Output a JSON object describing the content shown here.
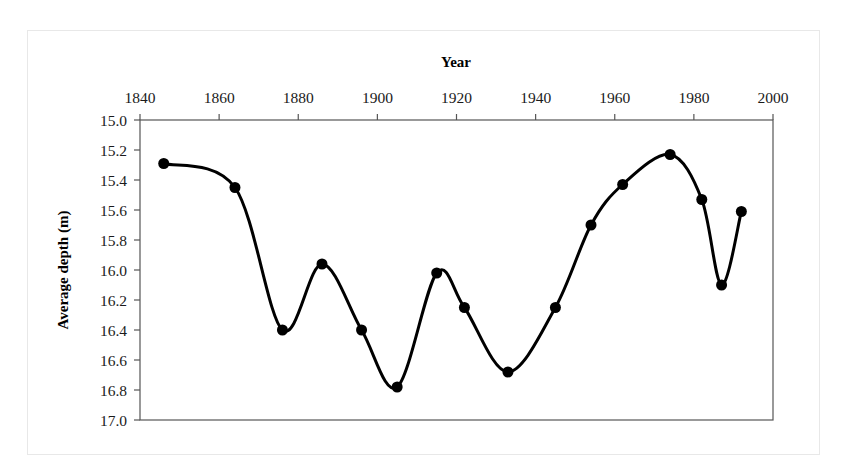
{
  "figure": {
    "background_color": "#ffffff",
    "outer_border_color": "#e8e8e8",
    "axis_color": "#555555",
    "series_color": "#000000"
  },
  "chart_data": {
    "type": "line",
    "title": "",
    "xlabel": "Year",
    "ylabel": "Average depth (m)",
    "xlim": [
      1840,
      2000
    ],
    "ylim": [
      15.0,
      17.0
    ],
    "y_inverted": true,
    "grid": false,
    "legend": null,
    "xticks": [
      1840,
      1860,
      1880,
      1900,
      1920,
      1940,
      1960,
      1980,
      2000
    ],
    "xtick_labels": [
      "1840",
      "1860",
      "1880",
      "1900",
      "1920",
      "1940",
      "1960",
      "1980",
      "2000"
    ],
    "yticks": [
      15.0,
      15.2,
      15.4,
      15.6,
      15.8,
      16.0,
      16.2,
      16.4,
      16.6,
      16.8,
      17.0
    ],
    "ytick_labels": [
      "15.0",
      "15.2",
      "15.4",
      "15.6",
      "15.8",
      "16.0",
      "16.2",
      "16.4",
      "16.6",
      "16.8",
      "17.0"
    ],
    "x_axis_position": "top",
    "marker": "circle",
    "marker_size": 7,
    "line_width": 3,
    "smoothing": "spline",
    "x": [
      1846,
      1864,
      1876,
      1886,
      1896,
      1905,
      1915,
      1922,
      1933,
      1945,
      1954,
      1962,
      1974,
      1982,
      1987,
      1992
    ],
    "y": [
      15.29,
      15.45,
      16.4,
      15.96,
      16.4,
      16.78,
      16.02,
      16.25,
      16.68,
      16.25,
      15.7,
      15.43,
      15.23,
      15.53,
      16.1,
      15.61
    ],
    "series": [
      {
        "name": "Average depth",
        "values": [
          15.29,
          15.45,
          16.4,
          15.96,
          16.4,
          16.78,
          16.02,
          16.25,
          16.68,
          16.25,
          15.7,
          15.43,
          15.23,
          15.53,
          16.1,
          15.61
        ]
      }
    ]
  }
}
